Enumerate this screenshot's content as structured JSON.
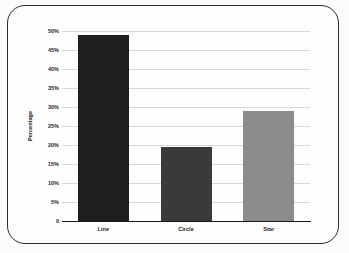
{
  "chart_data": {
    "type": "bar",
    "title": "",
    "xlabel": "",
    "ylabel": "Percentage",
    "categories": [
      "Line",
      "Circle",
      "Star"
    ],
    "values": [
      49,
      19.5,
      29
    ],
    "value_labels": [
      "49%",
      "19.5%",
      "29%"
    ],
    "ylim": [
      0,
      50
    ],
    "ytick_values": [
      0,
      5,
      10,
      15,
      20,
      25,
      30,
      35,
      40,
      45,
      50
    ],
    "ytick_labels": [
      "0",
      "5%",
      "10%",
      "15%",
      "20%",
      "25%",
      "30%",
      "35%",
      "40%",
      "45%",
      "50%"
    ],
    "grid": true,
    "legend": "none",
    "bar_colors": [
      "#1e1e1e",
      "#3a3a3a",
      "#8c8c8c"
    ]
  },
  "figure": {
    "background_color": "#fdfdfc",
    "border_color": "#2a2a2a",
    "gridline_color": "#d8d8d8",
    "axis_color": "#1a1a1a"
  }
}
